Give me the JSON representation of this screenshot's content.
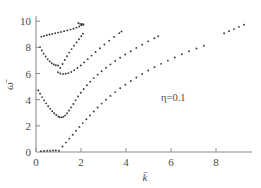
{
  "chart_data": {
    "type": "scatter",
    "title": "",
    "xlabel": "k̄",
    "ylabel": "ω̄",
    "xlim": [
      0,
      9.6
    ],
    "ylim": [
      0,
      10.4
    ],
    "xticks": [
      0,
      2,
      4,
      6,
      8
    ],
    "yticks": [
      0,
      2,
      4,
      6,
      8,
      10
    ],
    "xtick_labels": [
      "0",
      "2",
      "4",
      "6",
      "8"
    ],
    "ytick_labels": [
      "0",
      "2",
      "4",
      "6",
      "8",
      "10"
    ],
    "grid": false,
    "legend": false,
    "marker": "dot",
    "marker_color": "#3a3a3a",
    "axis_color": "#8c8c8c",
    "annotations": [
      {
        "text": "η=0.1",
        "x": 6.1,
        "y": 3.9
      }
    ],
    "series": [
      {
        "name": "branch-1-acoustic-zero",
        "points": [
          [
            0.22,
            0.06
          ],
          [
            0.36,
            0.08
          ],
          [
            0.5,
            0.09
          ],
          [
            0.63,
            0.1
          ],
          [
            0.76,
            0.11
          ],
          [
            0.88,
            0.12
          ]
        ]
      },
      {
        "name": "branch-2-acoustic-rising",
        "points": [
          [
            1.02,
            0.1
          ],
          [
            1.18,
            0.42
          ],
          [
            1.33,
            0.72
          ],
          [
            1.48,
            1.02
          ],
          [
            1.63,
            1.32
          ],
          [
            1.78,
            1.62
          ],
          [
            1.93,
            1.92
          ],
          [
            2.08,
            2.21
          ],
          [
            2.24,
            2.5
          ],
          [
            2.4,
            2.8
          ],
          [
            2.57,
            3.1
          ],
          [
            2.74,
            3.4
          ],
          [
            2.92,
            3.7
          ],
          [
            3.11,
            4.0
          ],
          [
            3.31,
            4.29
          ],
          [
            3.52,
            4.58
          ],
          [
            3.74,
            4.87
          ],
          [
            3.97,
            5.15
          ],
          [
            4.21,
            5.43
          ],
          [
            4.46,
            5.7
          ],
          [
            4.72,
            5.97
          ],
          [
            4.99,
            6.23
          ],
          [
            5.27,
            6.49
          ],
          [
            5.56,
            6.74
          ],
          [
            5.86,
            6.99
          ],
          [
            6.17,
            7.23
          ],
          [
            6.48,
            7.47
          ],
          [
            6.8,
            7.7
          ],
          [
            7.13,
            7.92
          ],
          [
            7.46,
            8.13
          ]
        ]
      },
      {
        "name": "branch-2b-acoustic-upper-segment",
        "points": [
          [
            8.36,
            9.08
          ],
          [
            8.58,
            9.24
          ],
          [
            8.8,
            9.4
          ],
          [
            9.02,
            9.57
          ],
          [
            9.24,
            9.74
          ]
        ]
      },
      {
        "name": "branch-3-optical-low-V",
        "points": [
          [
            0.1,
            4.72
          ],
          [
            0.18,
            4.46
          ],
          [
            0.27,
            4.2
          ],
          [
            0.36,
            3.95
          ],
          [
            0.45,
            3.72
          ],
          [
            0.54,
            3.5
          ],
          [
            0.63,
            3.3
          ],
          [
            0.72,
            3.12
          ],
          [
            0.81,
            2.96
          ],
          [
            0.9,
            2.83
          ],
          [
            0.99,
            2.72
          ],
          [
            1.06,
            2.66
          ],
          [
            1.14,
            2.65
          ],
          [
            1.22,
            2.69
          ],
          [
            1.3,
            2.8
          ],
          [
            1.38,
            2.96
          ],
          [
            1.47,
            3.17
          ],
          [
            1.56,
            3.41
          ],
          [
            1.66,
            3.67
          ],
          [
            1.76,
            3.95
          ],
          [
            1.87,
            4.24
          ],
          [
            1.99,
            4.53
          ],
          [
            2.12,
            4.82
          ],
          [
            2.26,
            5.1
          ],
          [
            2.41,
            5.38
          ],
          [
            2.57,
            5.65
          ],
          [
            2.74,
            5.92
          ],
          [
            2.92,
            6.18
          ],
          [
            3.11,
            6.44
          ],
          [
            3.31,
            6.7
          ],
          [
            3.52,
            6.96
          ],
          [
            3.74,
            7.21
          ],
          [
            3.97,
            7.46
          ],
          [
            4.21,
            7.71
          ],
          [
            4.46,
            7.96
          ],
          [
            4.72,
            8.21
          ],
          [
            4.99,
            8.46
          ],
          [
            5.26,
            8.7
          ],
          [
            5.43,
            8.85
          ]
        ]
      },
      {
        "name": "branch-4-optical-mid-V",
        "points": [
          [
            0.18,
            8.02
          ],
          [
            0.26,
            7.76
          ],
          [
            0.34,
            7.52
          ],
          [
            0.43,
            7.3
          ],
          [
            0.52,
            7.1
          ],
          [
            0.61,
            6.93
          ],
          [
            0.7,
            6.79
          ],
          [
            0.79,
            6.69
          ],
          [
            0.88,
            6.63
          ],
          [
            0.98,
            6.62
          ],
          [
            1.08,
            6.0
          ],
          [
            1.2,
            5.97
          ],
          [
            1.32,
            5.98
          ],
          [
            1.44,
            6.03
          ],
          [
            1.57,
            6.12
          ],
          [
            1.7,
            6.25
          ],
          [
            1.84,
            6.42
          ],
          [
            1.99,
            6.62
          ],
          [
            2.14,
            6.85
          ],
          [
            2.3,
            7.1
          ],
          [
            2.47,
            7.37
          ],
          [
            2.65,
            7.65
          ],
          [
            2.84,
            7.93
          ],
          [
            3.04,
            8.22
          ],
          [
            3.25,
            8.51
          ],
          [
            3.47,
            8.8
          ],
          [
            3.7,
            9.09
          ],
          [
            3.8,
            9.22
          ]
        ]
      },
      {
        "name": "branch-5-optical-steep",
        "points": [
          [
            0.98,
            6.1
          ],
          [
            1.08,
            6.42
          ],
          [
            1.18,
            6.73
          ],
          [
            1.28,
            7.03
          ],
          [
            1.38,
            7.32
          ],
          [
            1.48,
            7.6
          ],
          [
            1.58,
            7.87
          ],
          [
            1.69,
            8.13
          ],
          [
            1.8,
            8.38
          ],
          [
            1.91,
            8.62
          ],
          [
            2.01,
            8.85
          ],
          [
            2.09,
            9.05
          ]
        ]
      },
      {
        "name": "branch-6-optical-upper-flat",
        "points": [
          [
            0.24,
            8.82
          ],
          [
            0.36,
            8.88
          ],
          [
            0.48,
            8.93
          ],
          [
            0.6,
            8.98
          ],
          [
            0.72,
            9.03
          ],
          [
            0.85,
            9.08
          ],
          [
            0.98,
            9.13
          ],
          [
            1.11,
            9.18
          ],
          [
            1.25,
            9.24
          ],
          [
            1.39,
            9.3
          ],
          [
            1.53,
            9.36
          ],
          [
            1.67,
            9.43
          ],
          [
            1.8,
            9.51
          ],
          [
            1.92,
            9.6
          ],
          [
            2.01,
            9.7
          ],
          [
            2.07,
            9.8
          ]
        ]
      },
      {
        "name": "branch-7-optical-top-short",
        "points": [
          [
            1.88,
            9.86
          ],
          [
            1.96,
            9.8
          ],
          [
            2.04,
            9.76
          ],
          [
            2.11,
            9.73
          ]
        ]
      }
    ]
  }
}
